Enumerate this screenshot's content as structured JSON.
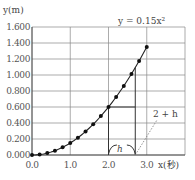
{
  "chart_data": {
    "type": "line",
    "title": "",
    "equation_label": "y = 0.15x²",
    "xlabel": "x(秒)",
    "ylabel": "y(m)",
    "xlim": [
      0,
      4.0
    ],
    "ylim": [
      0,
      1.6
    ],
    "x_ticks": [
      "0.0",
      "1.0",
      "2.0",
      "3.0"
    ],
    "y_ticks": [
      "0.000",
      "0.200",
      "0.400",
      "0.600",
      "0.800",
      "1.000",
      "1.200",
      "1.400",
      "1.600"
    ],
    "grid": true,
    "series": [
      {
        "name": "y = 0.15x²",
        "x": [
          0.0,
          0.2,
          0.4,
          0.6,
          0.8,
          1.0,
          1.2,
          1.4,
          1.6,
          1.8,
          2.0,
          2.2,
          2.4,
          2.6,
          2.8,
          3.0
        ],
        "y": [
          0.0,
          0.006,
          0.024,
          0.054,
          0.096,
          0.15,
          0.216,
          0.294,
          0.384,
          0.486,
          0.6,
          0.726,
          0.864,
          1.014,
          1.176,
          1.35
        ]
      }
    ],
    "annotations": [
      {
        "type": "bracket",
        "label": "h",
        "from_x": 2.0,
        "to_x": 2.7
      },
      {
        "type": "leader",
        "label": "2+h",
        "at_x": 2.7
      },
      {
        "type": "guide-lines",
        "x_start": 2.0,
        "y_start": 0.6,
        "x_end": 2.7
      }
    ]
  },
  "labels": {
    "y_axis": "y(m)",
    "x_axis": "x(秒)",
    "equation": "y = 0.15x²",
    "h": "h",
    "two_plus_h": "2 + h"
  }
}
